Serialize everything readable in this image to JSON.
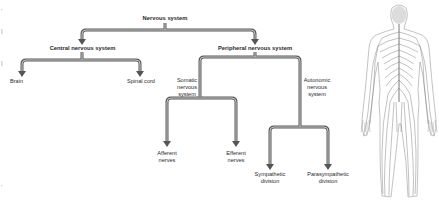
{
  "diagram": {
    "title": "Nervous system",
    "nodes": {
      "root": "Nervous system",
      "cns": "Central nervous system",
      "pns": "Peripheral nervous system",
      "brain": "Brain",
      "spinal_cord": "Spinal cord",
      "somatic": [
        "Somatic",
        "nervous",
        "system"
      ],
      "autonomic": [
        "Autonomic",
        "nervous",
        "system"
      ],
      "afferent": [
        "Afferent",
        "nerves"
      ],
      "efferent": [
        "Efferent",
        "nerves"
      ],
      "sympathetic": [
        "Sympathetic",
        "division"
      ],
      "parasympathetic": [
        "Parasympathetic",
        "division"
      ]
    },
    "edges": [
      [
        "Nervous system",
        "Central nervous system"
      ],
      [
        "Nervous system",
        "Peripheral nervous system"
      ],
      [
        "Central nervous system",
        "Brain"
      ],
      [
        "Central nervous system",
        "Spinal cord"
      ],
      [
        "Peripheral nervous system",
        "Somatic nervous system"
      ],
      [
        "Peripheral nervous system",
        "Autonomic nervous system"
      ],
      [
        "Somatic nervous system",
        "Afferent nerves"
      ],
      [
        "Somatic nervous system",
        "Efferent nerves"
      ],
      [
        "Autonomic nervous system",
        "Sympathetic division"
      ],
      [
        "Autonomic nervous system",
        "Parasympathetic division"
      ]
    ],
    "colors": {
      "line": "#5a5a5a",
      "line_inner": "#bdbdbd",
      "text": "#2a2a2a"
    },
    "illustration": "human-nervous-system-back-view"
  }
}
